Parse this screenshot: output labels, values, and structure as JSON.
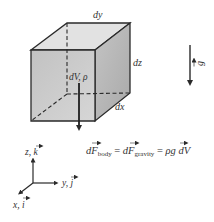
{
  "diagram": {
    "colors": {
      "front_face": "#c9c9c9",
      "top_face": "#e4e4e4",
      "side_face": "#b8b8b8",
      "edge": "#2a2a2a",
      "text": "#333333"
    },
    "cube": {
      "label_dy": "dy",
      "label_dz": "dz",
      "label_dx": "dx",
      "label_element": "dV, ρ"
    },
    "gravity": {
      "symbol": "g",
      "vector_mark": "→"
    },
    "equation": {
      "part1_d": "d",
      "part1_F": "F",
      "part1_sub": "body",
      "eq1": " = ",
      "part2_d": "d",
      "part2_F": "F",
      "part2_sub": "gravity",
      "eq2": " = ",
      "part3": "ρ",
      "part3_g": "g",
      "part3_tail": " dV"
    },
    "axes": {
      "z_label": "z, ",
      "z_unit": "k",
      "y_label": "y, ",
      "y_unit": "j",
      "x_label": "x, ",
      "x_unit": "i"
    }
  }
}
